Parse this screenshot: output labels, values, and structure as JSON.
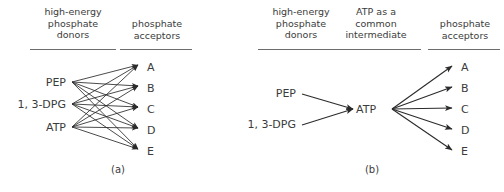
{
  "figure": {
    "panels": [
      {
        "id": "a",
        "caption": "(a)",
        "headings": [
          {
            "id": "donors",
            "text": "high-energy\nphosphate\ndonors",
            "x": 30,
            "y": 6,
            "width": 86,
            "rule_x": 30,
            "rule_y": 49,
            "rule_w": 86
          },
          {
            "id": "acceptors",
            "text": "phosphate\nacceptors",
            "x": 118,
            "y": 18,
            "width": 78,
            "rule_x": 120,
            "rule_y": 49,
            "rule_w": 72
          }
        ],
        "donors": [
          {
            "label": "PEP",
            "x": 18,
            "y": 77,
            "w": 48,
            "node_x": 72,
            "node_y": 82
          },
          {
            "label": "1, 3-DPG",
            "x": 10,
            "y": 99,
            "w": 56,
            "node_x": 72,
            "node_y": 104
          },
          {
            "label": "ATP",
            "x": 18,
            "y": 122,
            "w": 48,
            "node_x": 72,
            "node_y": 127
          }
        ],
        "acceptors": [
          {
            "label": "A",
            "x": 147,
            "y": 62,
            "node_x": 138,
            "node_y": 65
          },
          {
            "label": "B",
            "x": 147,
            "y": 83,
            "node_x": 138,
            "node_y": 86
          },
          {
            "label": "C",
            "x": 147,
            "y": 104,
            "node_x": 138,
            "node_y": 107
          },
          {
            "label": "D",
            "x": 147,
            "y": 125,
            "node_x": 138,
            "node_y": 128
          },
          {
            "label": "E",
            "x": 147,
            "y": 146,
            "node_x": 138,
            "node_y": 149
          }
        ],
        "edges_description": "every donor connects to every acceptor",
        "caption_x": 88,
        "caption_y": 164,
        "caption_w": 60
      },
      {
        "id": "b",
        "caption": "(b)",
        "headings": [
          {
            "id": "donors",
            "text": "high-energy\nphosphate\ndonors",
            "x": 12,
            "y": 6,
            "width": 86,
            "rule_x": 12,
            "rule_y": 49,
            "rule_w": 86
          },
          {
            "id": "intermediate",
            "text": "ATP as a\ncommon\nintermediate",
            "x": 82,
            "y": 6,
            "width": 96,
            "rule_x": 85,
            "rule_y": 49,
            "rule_w": 90
          },
          {
            "id": "acceptors",
            "text": "phosphate\nacceptors",
            "x": 180,
            "y": 18,
            "width": 78,
            "rule_x": 182,
            "rule_y": 49,
            "rule_w": 72
          }
        ],
        "donors": [
          {
            "label": "PEP",
            "x": 6,
            "y": 88,
            "w": 44,
            "node_x": 56,
            "node_y": 94
          },
          {
            "label": "1, 3-DPG",
            "x": -2,
            "y": 119,
            "w": 52,
            "node_x": 56,
            "node_y": 125
          }
        ],
        "intermediate": {
          "label": "ATP",
          "x": 110,
          "y": 104,
          "w": 30,
          "in_x": 107,
          "in_y": 109,
          "out_x": 146,
          "out_y": 109
        },
        "acceptors": [
          {
            "label": "A",
            "x": 215,
            "y": 62,
            "node_x": 206,
            "node_y": 66
          },
          {
            "label": "B",
            "x": 215,
            "y": 83,
            "node_x": 206,
            "node_y": 87
          },
          {
            "label": "C",
            "x": 215,
            "y": 104,
            "node_x": 206,
            "node_y": 108
          },
          {
            "label": "D",
            "x": 215,
            "y": 125,
            "node_x": 206,
            "node_y": 129
          },
          {
            "label": "E",
            "x": 215,
            "y": 146,
            "node_x": 206,
            "node_y": 150
          }
        ],
        "edges_description": "donors converge on ATP; ATP diverges to all acceptors",
        "caption_x": 96,
        "caption_y": 164,
        "caption_w": 60
      }
    ],
    "colors": {
      "text": "#3b3b3b",
      "arrow": "#2b2b2b",
      "rule": "#6d6d6d",
      "background": "#ffffff"
    }
  }
}
